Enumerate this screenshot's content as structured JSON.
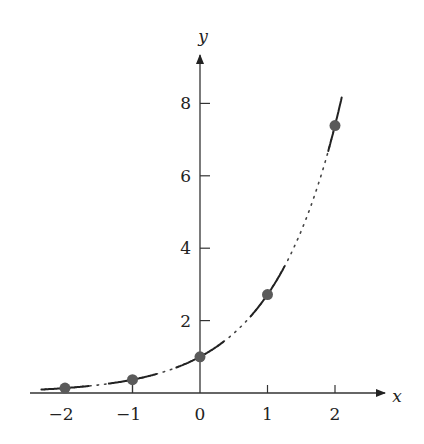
{
  "chart_data": {
    "type": "line",
    "title": "",
    "xlabel": "x",
    "ylabel": "y",
    "function": "y = e^x",
    "xlim": [
      -2.4,
      2.6
    ],
    "ylim": [
      0,
      9
    ],
    "x_ticks": [
      -2,
      -1,
      0,
      1,
      2
    ],
    "x_tick_labels": [
      "−2",
      "−1",
      "0",
      "1",
      "2"
    ],
    "y_ticks": [
      2,
      4,
      6,
      8
    ],
    "y_tick_labels": [
      "2",
      "4",
      "6",
      "8"
    ],
    "grid": false,
    "legend": null,
    "points": [
      {
        "x": -2,
        "y": 0.135
      },
      {
        "x": -1,
        "y": 0.368
      },
      {
        "x": 0,
        "y": 1.0
      },
      {
        "x": 1,
        "y": 2.718
      },
      {
        "x": 2,
        "y": 7.389
      }
    ],
    "curve_style": "dotted",
    "tangent_segments": "solid short tangent lines at each marked point",
    "colors": {
      "point": "#5a5a5a",
      "line": "#222222",
      "axis": "#333333"
    }
  }
}
